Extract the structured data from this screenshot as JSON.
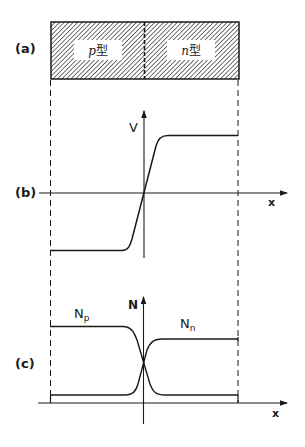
{
  "figure": {
    "panel_a": {
      "label": "(a)",
      "regions": [
        {
          "name": "p-region",
          "letter": "p",
          "suffix": "型"
        },
        {
          "name": "n-region",
          "letter": "n",
          "suffix": "型"
        }
      ]
    },
    "panel_b": {
      "label": "(b)",
      "y_axis_label": "V",
      "x_axis_label": "x",
      "curve": "step-up potential across junction"
    },
    "panel_c": {
      "label": "(c)",
      "y_axis_label": "N",
      "x_axis_label": "x",
      "series": [
        {
          "name": "N",
          "subscript": "p",
          "shape": "high on p side, decreasing across junction"
        },
        {
          "name": "N",
          "subscript": "n",
          "shape": "low on p side, increasing across junction"
        }
      ]
    }
  },
  "colors": {
    "ink": "#1a1a1a",
    "background": "#ffffff"
  }
}
